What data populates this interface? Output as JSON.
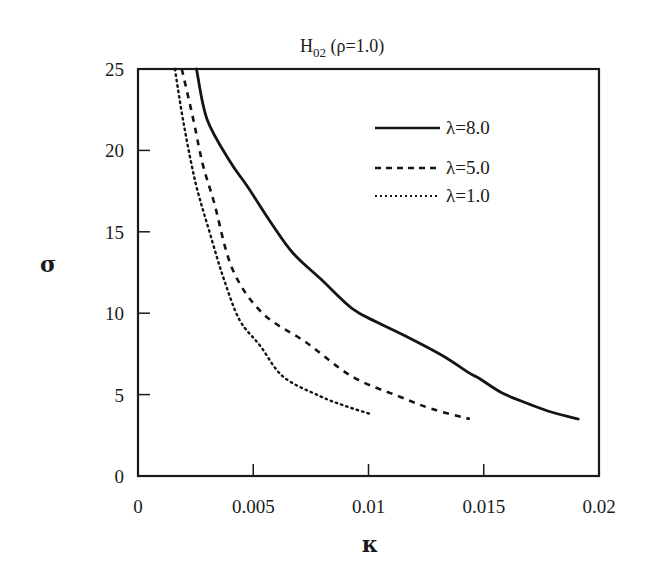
{
  "chart_data": {
    "type": "line",
    "title": "H02 (ρ=1.0)",
    "title_main": "H",
    "title_sub": "02",
    "title_rest": " (ρ=1.0)",
    "xlabel": "κ",
    "ylabel": "σ",
    "xlim": [
      0,
      0.02
    ],
    "ylim": [
      0,
      25
    ],
    "xticks": [
      0,
      0.005,
      0.01,
      0.015,
      0.02
    ],
    "xtick_labels": [
      "0",
      "0.005",
      "0.01",
      "0.015",
      "0.02"
    ],
    "yticks": [
      0,
      5,
      10,
      15,
      20,
      25
    ],
    "ytick_labels": [
      "0",
      "5",
      "10",
      "15",
      "20",
      "25"
    ],
    "grid": false,
    "legend_position": "upper right",
    "series": [
      {
        "name": "λ=8.0",
        "style": "solid",
        "x": [
          0.00254,
          0.003,
          0.004,
          0.00474,
          0.0058,
          0.00672,
          0.008,
          0.0088,
          0.0096,
          0.0116,
          0.0132,
          0.0144,
          0.0148,
          0.0158,
          0.017,
          0.018,
          0.0191
        ],
        "y": [
          25.0,
          21.9,
          19.3,
          17.8,
          15.5,
          13.7,
          12.0,
          10.9,
          10.0,
          8.6,
          7.4,
          6.3,
          6.0,
          5.1,
          4.4,
          3.9,
          3.5
        ]
      },
      {
        "name": "λ=5.0",
        "style": "dashed",
        "x": [
          0.0019,
          0.0024,
          0.0028,
          0.0033,
          0.0041,
          0.0054,
          0.0057,
          0.0073,
          0.0093,
          0.0113,
          0.0128,
          0.0144
        ],
        "y": [
          25.0,
          21.9,
          19.2,
          16.8,
          12.7,
          10.0,
          10.4,
          8.2,
          6.1,
          4.9,
          4.1,
          3.5
        ]
      },
      {
        "name": "λ=1.0",
        "style": "dotted",
        "x": [
          0.0016,
          0.002,
          0.0025,
          0.0031,
          0.0037,
          0.0044,
          0.0053,
          0.0063,
          0.0079,
          0.009,
          0.0101
        ],
        "y": [
          25.0,
          21.5,
          18.0,
          15.0,
          12.2,
          9.6,
          8.0,
          6.1,
          4.9,
          4.3,
          3.8
        ]
      }
    ]
  },
  "legend": [
    {
      "label": "λ=8.0",
      "style": "solid"
    },
    {
      "label": "λ=5.0",
      "style": "dashed"
    },
    {
      "label": "λ=1.0",
      "style": "dotted"
    }
  ],
  "colors": {
    "line": "#141414",
    "axis": "#1a1a1a",
    "background": "#ffffff"
  }
}
